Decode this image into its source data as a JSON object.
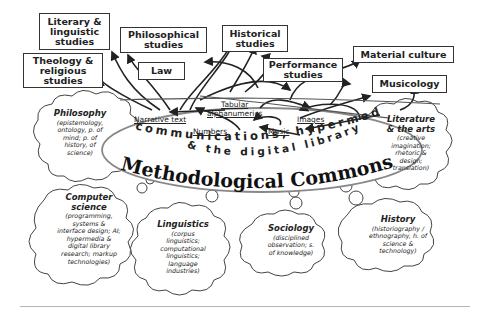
{
  "diagram": {
    "title": "Methodological Commons",
    "subtitle_line1": "communications, hypermedia",
    "subtitle_line2": "& the digital library",
    "disciplines": [
      {
        "id": "literary",
        "label": "Literary &\nlinguistic\nstudies"
      },
      {
        "id": "philosophical",
        "label": "Philosophical\nstudies"
      },
      {
        "id": "historical",
        "label": "Historical\nstudies"
      },
      {
        "id": "theology",
        "label": "Theology &\nreligious\nstudies"
      },
      {
        "id": "law",
        "label": "Law"
      },
      {
        "id": "performance",
        "label": "Performance\nstudies"
      },
      {
        "id": "material",
        "label": "Material culture"
      },
      {
        "id": "musicology",
        "label": "Musicology"
      }
    ],
    "data_types": [
      {
        "id": "narrative",
        "label": "Narrative text"
      },
      {
        "id": "tabular",
        "label": "Tabular\nalphanumerics"
      },
      {
        "id": "images",
        "label": "Images"
      },
      {
        "id": "numbers",
        "label": "Numbers"
      },
      {
        "id": "music",
        "label": "Music"
      }
    ],
    "clouds": [
      {
        "id": "philosophy",
        "title": "Philosophy",
        "desc": "(epistemology,\nontology, p. of\nmind; p. of\nhistory, of\nscience)"
      },
      {
        "id": "literature",
        "title": "Literature\n& the arts",
        "desc": "(creative\nimagination;\nrhetoric &\ndesign;\ntranslation)"
      },
      {
        "id": "computer",
        "title": "Computer\nscience",
        "desc": "(programming,\nsystems &\ninterface design; AI;\nhypermedia &\ndigital library\nresearch; markup\ntechnologies)"
      },
      {
        "id": "linguistics",
        "title": "Linguistics",
        "desc": "(corpus\nlinguistics;\ncomputational\nlinguistics;\nlanguage\nindustries)"
      },
      {
        "id": "sociology",
        "title": "Sociology",
        "desc": "(disciplined\nobservation; s.\nof knowledge)"
      },
      {
        "id": "history",
        "title": "History",
        "desc": "(historiography /\nethnography, h. of\nscience &\ntechnology)"
      }
    ]
  }
}
